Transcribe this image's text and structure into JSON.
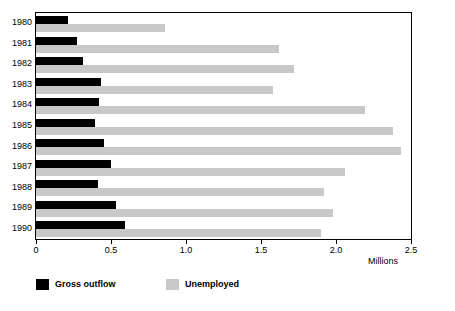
{
  "chart_data": {
    "type": "bar",
    "orientation": "horizontal",
    "title": "",
    "subtitle": "",
    "xlabel": "Millions",
    "ylabel": "",
    "xlim": [
      0,
      2.5
    ],
    "xticks": [
      0,
      0.5,
      1.0,
      1.5,
      2.0,
      2.5
    ],
    "xticklabels": [
      "0",
      "0.5",
      "1.0",
      "1.5",
      "2.0",
      "2.5"
    ],
    "grid": false,
    "legend_position": "bottom-left",
    "categories": [
      "1980",
      "1981",
      "1982",
      "1983",
      "1984",
      "1985",
      "1986",
      "1987",
      "1988",
      "1989",
      "1990"
    ],
    "series": [
      {
        "name": "Gross outflow",
        "color": "#000000",
        "values": [
          0.21,
          0.27,
          0.31,
          0.43,
          0.42,
          0.39,
          0.45,
          0.5,
          0.41,
          0.53,
          0.59
        ]
      },
      {
        "name": "Unemployed",
        "color": "#c8c8c8",
        "values": [
          0.86,
          1.62,
          1.72,
          1.58,
          2.19,
          2.38,
          2.43,
          2.06,
          1.92,
          1.98,
          1.9
        ]
      }
    ]
  },
  "legend": {
    "items": [
      {
        "label": "Gross outflow",
        "color": "#000000"
      },
      {
        "label": "Unemployed",
        "color": "#c8c8c8"
      }
    ]
  }
}
